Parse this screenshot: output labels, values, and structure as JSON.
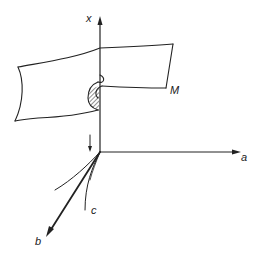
{
  "figure": {
    "type": "3D coordinate diagram with folded surface",
    "labels": {
      "x_axis": "x",
      "a_axis": "a",
      "b_axis": "b",
      "curve": "c",
      "surface": "M"
    },
    "colors": {
      "ink": "#222222",
      "background": "#ffffff"
    },
    "elements": [
      {
        "name": "x-axis",
        "direction": "up",
        "arrow": true
      },
      {
        "name": "a-axis",
        "direction": "right",
        "arrow": true
      },
      {
        "name": "b-axis",
        "direction": "down-left",
        "arrow": true,
        "bold": true
      },
      {
        "name": "curve-c",
        "description": "curve from origin"
      },
      {
        "name": "curve-2",
        "description": "second curve from origin"
      },
      {
        "name": "down-arrow",
        "description": "projection arrow pointing down toward origin"
      },
      {
        "name": "surface-M",
        "description": "folded surface with hatched fold region"
      }
    ]
  }
}
